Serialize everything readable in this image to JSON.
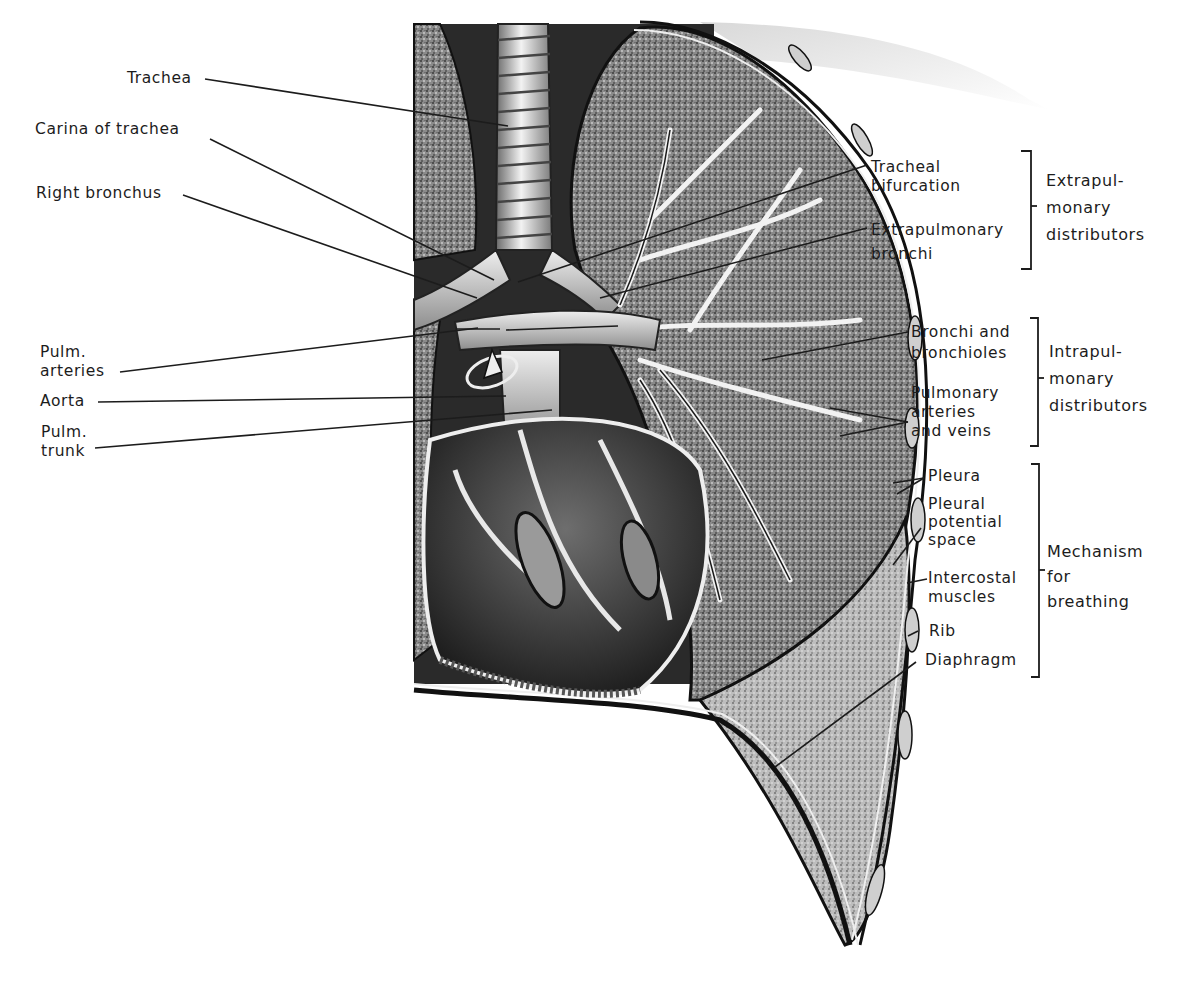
{
  "figure": {
    "background_color": "#ffffff",
    "ink_color": "#1c1c1c",
    "left_labels": [
      {
        "id": "trachea",
        "text": "Trachea"
      },
      {
        "id": "carina",
        "text": "Carina of trachea"
      },
      {
        "id": "right-bronchus",
        "text": "Right bronchus"
      },
      {
        "id": "pulm-arteries",
        "text": "Pulm.\narteries"
      },
      {
        "id": "aorta",
        "text": "Aorta"
      },
      {
        "id": "pulm-trunk",
        "text": "Pulm.\ntrunk"
      }
    ],
    "right_labels": [
      {
        "id": "tracheal-bifurcation",
        "text": "Tracheal\nbifurcation"
      },
      {
        "id": "extrapulmonary-bronchi",
        "text": "Extrapulmonary\nbronchi"
      },
      {
        "id": "bronchi-bronchioles",
        "text": "Bronchi and\nbronchioles"
      },
      {
        "id": "pulmonary-arteries-veins",
        "text": "Pulmonary\narteries\nand veins"
      },
      {
        "id": "pleura",
        "text": "Pleura"
      },
      {
        "id": "pleural-potential-space",
        "text": "Pleural\npotential\nspace"
      },
      {
        "id": "intercostal-muscles",
        "text": "Intercostal\nmuscles"
      },
      {
        "id": "rib",
        "text": "Rib"
      },
      {
        "id": "diaphragm",
        "text": "Diaphragm"
      }
    ],
    "groups": [
      {
        "id": "extrapulmonary-distributors",
        "text": "Extrapul-\nmonary\ndistributors",
        "members": [
          "Tracheal bifurcation",
          "Extrapulmonary bronchi"
        ]
      },
      {
        "id": "intrapulmonary-distributors",
        "text": "Intrapul-\nmonary\ndistributors",
        "members": [
          "Bronchi and bronchioles",
          "Pulmonary arteries and veins"
        ]
      },
      {
        "id": "mechanism-for-breathing",
        "text": "Mechanism\nfor\nbreathing",
        "members": [
          "Pleura",
          "Pleural potential space",
          "Intercostal muscles",
          "Rib",
          "Diaphragm"
        ]
      }
    ]
  }
}
